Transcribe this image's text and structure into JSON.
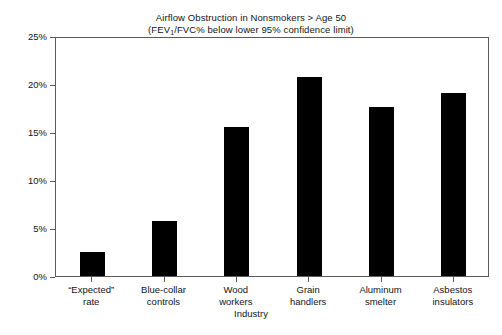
{
  "chart_data": {
    "type": "bar",
    "title": "Airflow Obstruction in Nonsmokers > Age 50",
    "subtitle_prefix": "(FEV",
    "subtitle_subscript": "1",
    "subtitle_suffix": "/FVC% below lower 95% confidence limit)",
    "xlabel": "Industry",
    "ylabel": "",
    "ylim": [
      0,
      25
    ],
    "ytick_labels": [
      "0%",
      "5%",
      "10%",
      "15%",
      "20%",
      "25%"
    ],
    "ytick_values": [
      0,
      5,
      10,
      15,
      20,
      25
    ],
    "grid": false,
    "legend": false,
    "bar_color": "#000000",
    "categories": [
      "“Expected”\nrate",
      "Blue-collar\ncontrols",
      "Wood\nworkers",
      "Grain\nhandlers",
      "Aluminum\nsmelter",
      "Asbestos\ninsulators"
    ],
    "category_lines": [
      [
        "“Expected”",
        "rate"
      ],
      [
        "Blue-collar",
        "controls"
      ],
      [
        "Wood",
        "workers"
      ],
      [
        "Grain",
        "handlers"
      ],
      [
        "Aluminum",
        "smelter"
      ],
      [
        "Asbestos",
        "insulators"
      ]
    ],
    "values": [
      2.5,
      5.7,
      15.5,
      20.7,
      17.6,
      19.1
    ],
    "value_unit": "%"
  }
}
